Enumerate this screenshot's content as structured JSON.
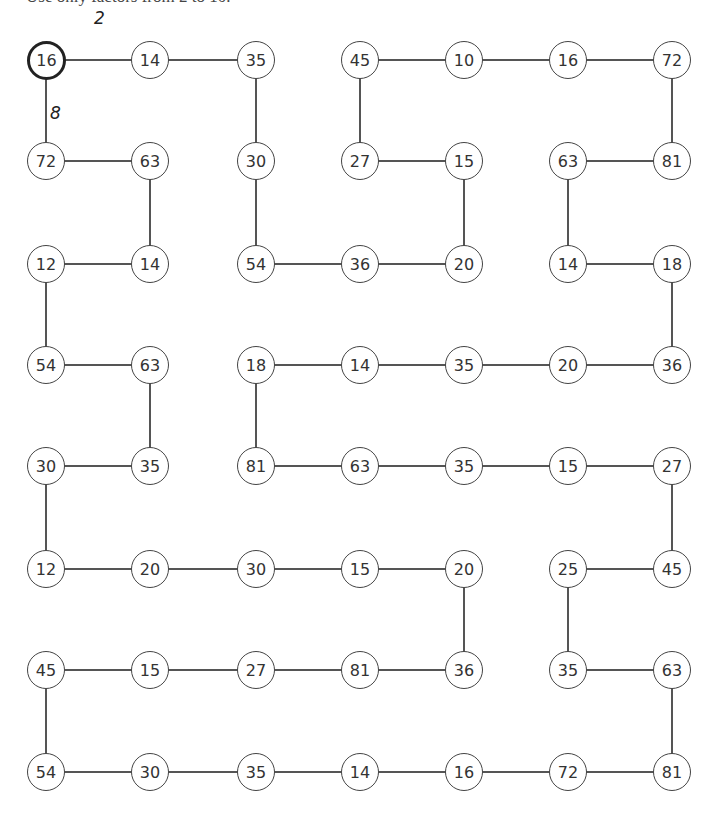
{
  "header": {
    "instruction": "Use only factors from 2 to 10."
  },
  "grid": {
    "columns_x": [
      46,
      150,
      256,
      360,
      464,
      568,
      672
    ],
    "rows_y": [
      60,
      161,
      264,
      365,
      466,
      569,
      670,
      772
    ],
    "nodes": [
      {
        "id": "r0c0",
        "r": 0,
        "c": 0,
        "value": "16",
        "start": true
      },
      {
        "id": "r0c1",
        "r": 0,
        "c": 1,
        "value": "14"
      },
      {
        "id": "r0c2",
        "r": 0,
        "c": 2,
        "value": "35"
      },
      {
        "id": "r0c3",
        "r": 0,
        "c": 3,
        "value": "45"
      },
      {
        "id": "r0c4",
        "r": 0,
        "c": 4,
        "value": "10"
      },
      {
        "id": "r0c5",
        "r": 0,
        "c": 5,
        "value": "16"
      },
      {
        "id": "r0c6",
        "r": 0,
        "c": 6,
        "value": "72"
      },
      {
        "id": "r1c0",
        "r": 1,
        "c": 0,
        "value": "72"
      },
      {
        "id": "r1c1",
        "r": 1,
        "c": 1,
        "value": "63"
      },
      {
        "id": "r1c2",
        "r": 1,
        "c": 2,
        "value": "30"
      },
      {
        "id": "r1c3",
        "r": 1,
        "c": 3,
        "value": "27"
      },
      {
        "id": "r1c4",
        "r": 1,
        "c": 4,
        "value": "15"
      },
      {
        "id": "r1c5",
        "r": 1,
        "c": 5,
        "value": "63"
      },
      {
        "id": "r1c6",
        "r": 1,
        "c": 6,
        "value": "81"
      },
      {
        "id": "r2c0",
        "r": 2,
        "c": 0,
        "value": "12"
      },
      {
        "id": "r2c1",
        "r": 2,
        "c": 1,
        "value": "14"
      },
      {
        "id": "r2c2",
        "r": 2,
        "c": 2,
        "value": "54"
      },
      {
        "id": "r2c3",
        "r": 2,
        "c": 3,
        "value": "36"
      },
      {
        "id": "r2c4",
        "r": 2,
        "c": 4,
        "value": "20"
      },
      {
        "id": "r2c5",
        "r": 2,
        "c": 5,
        "value": "14"
      },
      {
        "id": "r2c6",
        "r": 2,
        "c": 6,
        "value": "18"
      },
      {
        "id": "r3c0",
        "r": 3,
        "c": 0,
        "value": "54"
      },
      {
        "id": "r3c1",
        "r": 3,
        "c": 1,
        "value": "63"
      },
      {
        "id": "r3c2",
        "r": 3,
        "c": 2,
        "value": "18"
      },
      {
        "id": "r3c3",
        "r": 3,
        "c": 3,
        "value": "14"
      },
      {
        "id": "r3c4",
        "r": 3,
        "c": 4,
        "value": "35"
      },
      {
        "id": "r3c5",
        "r": 3,
        "c": 5,
        "value": "20"
      },
      {
        "id": "r3c6",
        "r": 3,
        "c": 6,
        "value": "36"
      },
      {
        "id": "r4c0",
        "r": 4,
        "c": 0,
        "value": "30"
      },
      {
        "id": "r4c1",
        "r": 4,
        "c": 1,
        "value": "35"
      },
      {
        "id": "r4c2",
        "r": 4,
        "c": 2,
        "value": "81"
      },
      {
        "id": "r4c3",
        "r": 4,
        "c": 3,
        "value": "63"
      },
      {
        "id": "r4c4",
        "r": 4,
        "c": 4,
        "value": "35"
      },
      {
        "id": "r4c5",
        "r": 4,
        "c": 5,
        "value": "15"
      },
      {
        "id": "r4c6",
        "r": 4,
        "c": 6,
        "value": "27"
      },
      {
        "id": "r5c0",
        "r": 5,
        "c": 0,
        "value": "12"
      },
      {
        "id": "r5c1",
        "r": 5,
        "c": 1,
        "value": "20"
      },
      {
        "id": "r5c2",
        "r": 5,
        "c": 2,
        "value": "30"
      },
      {
        "id": "r5c3",
        "r": 5,
        "c": 3,
        "value": "15"
      },
      {
        "id": "r5c4",
        "r": 5,
        "c": 4,
        "value": "20"
      },
      {
        "id": "r5c5",
        "r": 5,
        "c": 5,
        "value": "25"
      },
      {
        "id": "r5c6",
        "r": 5,
        "c": 6,
        "value": "45"
      },
      {
        "id": "r6c0",
        "r": 6,
        "c": 0,
        "value": "45"
      },
      {
        "id": "r6c1",
        "r": 6,
        "c": 1,
        "value": "15"
      },
      {
        "id": "r6c2",
        "r": 6,
        "c": 2,
        "value": "27"
      },
      {
        "id": "r6c3",
        "r": 6,
        "c": 3,
        "value": "81"
      },
      {
        "id": "r6c4",
        "r": 6,
        "c": 4,
        "value": "36"
      },
      {
        "id": "r6c5",
        "r": 6,
        "c": 5,
        "value": "35"
      },
      {
        "id": "r6c6",
        "r": 6,
        "c": 6,
        "value": "63"
      },
      {
        "id": "r7c0",
        "r": 7,
        "c": 0,
        "value": "54"
      },
      {
        "id": "r7c1",
        "r": 7,
        "c": 1,
        "value": "30"
      },
      {
        "id": "r7c2",
        "r": 7,
        "c": 2,
        "value": "35"
      },
      {
        "id": "r7c3",
        "r": 7,
        "c": 3,
        "value": "14"
      },
      {
        "id": "r7c4",
        "r": 7,
        "c": 4,
        "value": "16"
      },
      {
        "id": "r7c5",
        "r": 7,
        "c": 5,
        "value": "72"
      },
      {
        "id": "r7c6",
        "r": 7,
        "c": 6,
        "value": "81"
      }
    ],
    "edges": [
      [
        "r0c0",
        "r0c1"
      ],
      [
        "r0c1",
        "r0c2"
      ],
      [
        "r0c3",
        "r0c4"
      ],
      [
        "r0c4",
        "r0c5"
      ],
      [
        "r0c5",
        "r0c6"
      ],
      [
        "r0c0",
        "r1c0"
      ],
      [
        "r0c2",
        "r1c2"
      ],
      [
        "r0c3",
        "r1c3"
      ],
      [
        "r0c6",
        "r1c6"
      ],
      [
        "r1c0",
        "r1c1"
      ],
      [
        "r1c3",
        "r1c4"
      ],
      [
        "r1c5",
        "r1c6"
      ],
      [
        "r1c1",
        "r2c1"
      ],
      [
        "r1c2",
        "r2c2"
      ],
      [
        "r1c4",
        "r2c4"
      ],
      [
        "r1c5",
        "r2c5"
      ],
      [
        "r2c0",
        "r2c1"
      ],
      [
        "r2c2",
        "r2c3"
      ],
      [
        "r2c3",
        "r2c4"
      ],
      [
        "r2c5",
        "r2c6"
      ],
      [
        "r2c0",
        "r3c0"
      ],
      [
        "r2c6",
        "r3c6"
      ],
      [
        "r3c0",
        "r3c1"
      ],
      [
        "r3c2",
        "r3c3"
      ],
      [
        "r3c3",
        "r3c4"
      ],
      [
        "r3c4",
        "r3c5"
      ],
      [
        "r3c5",
        "r3c6"
      ],
      [
        "r3c1",
        "r4c1"
      ],
      [
        "r3c2",
        "r4c2"
      ],
      [
        "r4c0",
        "r4c1"
      ],
      [
        "r4c2",
        "r4c3"
      ],
      [
        "r4c3",
        "r4c4"
      ],
      [
        "r4c4",
        "r4c5"
      ],
      [
        "r4c5",
        "r4c6"
      ],
      [
        "r4c0",
        "r5c0"
      ],
      [
        "r4c6",
        "r5c6"
      ],
      [
        "r5c0",
        "r5c1"
      ],
      [
        "r5c1",
        "r5c2"
      ],
      [
        "r5c2",
        "r5c3"
      ],
      [
        "r5c3",
        "r5c4"
      ],
      [
        "r5c5",
        "r5c6"
      ],
      [
        "r5c4",
        "r6c4"
      ],
      [
        "r5c5",
        "r6c5"
      ],
      [
        "r6c0",
        "r6c1"
      ],
      [
        "r6c1",
        "r6c2"
      ],
      [
        "r6c2",
        "r6c3"
      ],
      [
        "r6c3",
        "r6c4"
      ],
      [
        "r6c5",
        "r6c6"
      ],
      [
        "r6c0",
        "r7c0"
      ],
      [
        "r6c6",
        "r7c6"
      ],
      [
        "r7c0",
        "r7c1"
      ],
      [
        "r7c1",
        "r7c2"
      ],
      [
        "r7c2",
        "r7c3"
      ],
      [
        "r7c3",
        "r7c4"
      ],
      [
        "r7c4",
        "r7c5"
      ],
      [
        "r7c5",
        "r7c6"
      ]
    ],
    "annotations": [
      {
        "label": "2",
        "x": 94,
        "y": 8,
        "edge": [
          "r0c0",
          "r0c1"
        ]
      },
      {
        "label": "8",
        "x": 50,
        "y": 103,
        "edge": [
          "r0c0",
          "r1c0"
        ]
      }
    ]
  }
}
